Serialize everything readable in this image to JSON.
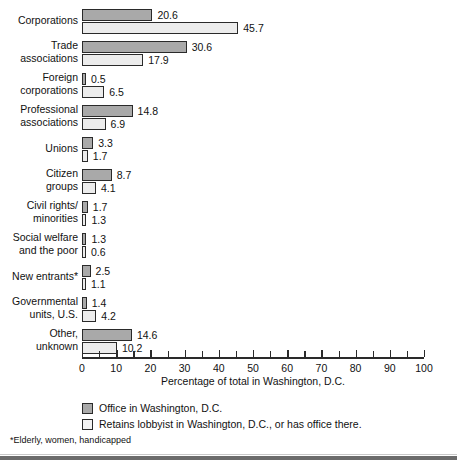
{
  "chart_data": {
    "type": "bar",
    "orientation": "horizontal",
    "title": "",
    "xlabel": "Percentage of total in Washington, D.C.",
    "ylabel": "",
    "xlim": [
      0,
      100
    ],
    "xticks": [
      0,
      10,
      20,
      30,
      40,
      50,
      60,
      70,
      80,
      90,
      100
    ],
    "minor_tick_step": 5,
    "grid": false,
    "legend_position": "below-axis-left",
    "categories": [
      "Corporations",
      "Trade associations",
      "Foreign corporations",
      "Professional associations",
      "Unions",
      "Citizen groups",
      "Civil rights/ minorities",
      "Social welfare and the poor",
      "New entrants*",
      "Governmental units, U.S.",
      "Other, unknown"
    ],
    "series": [
      {
        "name": "Office in Washington, D.C.",
        "color": "#a9a9a9",
        "values": [
          20.6,
          30.6,
          0.5,
          14.8,
          3.3,
          8.7,
          1.7,
          1.3,
          2.5,
          1.4,
          14.6
        ]
      },
      {
        "name": "Retains lobbyist in Washington, D.C., or has office there.",
        "color": "#ececec",
        "values": [
          45.7,
          17.9,
          6.5,
          6.9,
          1.7,
          4.1,
          1.3,
          0.6,
          1.1,
          4.2,
          10.2
        ]
      }
    ]
  },
  "rows": [
    {
      "label": "Corporations",
      "label_lines": 1,
      "dark": "20.6",
      "light": "45.7"
    },
    {
      "label": "Trade\nassociations",
      "label_lines": 2,
      "dark": "30.6",
      "light": "17.9"
    },
    {
      "label": "Foreign\ncorporations",
      "label_lines": 2,
      "dark": "0.5",
      "light": "6.5"
    },
    {
      "label": "Professional\nassociations",
      "label_lines": 2,
      "dark": "14.8",
      "light": "6.9"
    },
    {
      "label": "Unions",
      "label_lines": 1,
      "dark": "3.3",
      "light": "1.7"
    },
    {
      "label": "Citizen\ngroups",
      "label_lines": 2,
      "dark": "8.7",
      "light": "4.1"
    },
    {
      "label": "Civil rights/\nminorities",
      "label_lines": 2,
      "dark": "1.7",
      "light": "1.3"
    },
    {
      "label": "Social welfare\nand the poor",
      "label_lines": 2,
      "dark": "1.3",
      "light": "0.6"
    },
    {
      "label": "New entrants*",
      "label_lines": 1,
      "dark": "2.5",
      "light": "1.1"
    },
    {
      "label": "Governmental\nunits, U.S.",
      "label_lines": 2,
      "dark": "1.4",
      "light": "4.2"
    },
    {
      "label": "Other,\nunknown",
      "label_lines": 2,
      "dark": "14.6",
      "light": "10.2"
    }
  ],
  "axis": {
    "title": "Percentage of total in Washington, D.C.",
    "labels": [
      "0",
      "10",
      "20",
      "30",
      "40",
      "50",
      "60",
      "70",
      "80",
      "90",
      "100"
    ]
  },
  "legend": {
    "items": [
      {
        "swatch": "dark",
        "text": "Office in Washington, D.C."
      },
      {
        "swatch": "light",
        "text": "Retains lobbyist in Washington, D.C., or has office there."
      }
    ]
  },
  "footnote": "*Elderly, women, handicapped",
  "colors": {
    "dark_bar": "#a9a9a9",
    "light_bar": "#ececec",
    "outline": "#2a2a2a",
    "text": "#111111",
    "bottom_rule": "#6b6b6b"
  }
}
